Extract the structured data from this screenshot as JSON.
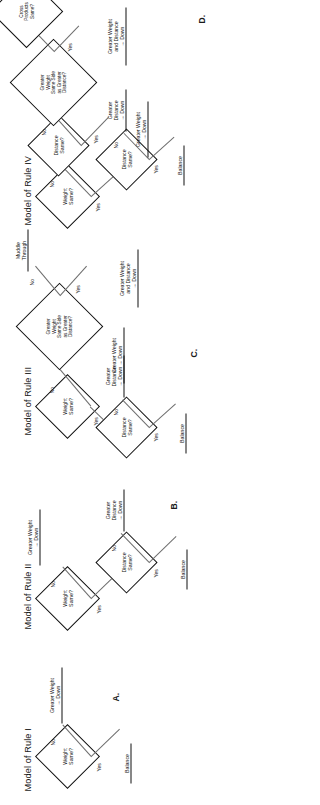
{
  "figure": {
    "orientation": "rotated-90-ccw",
    "caption_letters": [
      "A.",
      "B.",
      "C.",
      "D."
    ],
    "ink_color": "#111111",
    "line_color": "#6e6e6e"
  },
  "labels": {
    "yes": "Yes",
    "no": "No"
  },
  "questions": {
    "weight_same": "Weight\nSame?",
    "distance_same": "Distance\nSame?",
    "greater_weight_side": "Greater\nWeight\nSame Side\nas Greater\nDistance?",
    "cross_products_same": "Cross\nProducts\nSame?"
  },
  "outcomes": {
    "balance": "Balance",
    "greater_weight_down": "Greater Weight\n→ Down",
    "greater_distance_down": "Greater\nDistance\n→ Down",
    "greater_weight_and_distance_down": "Greater Weight\nand Distance\n→ Down",
    "muddle_through": "Muddle\nThrough",
    "greater_product_down": "Greater\nProduct\n→ Down"
  },
  "panels": [
    {
      "id": "rule1",
      "title": "Model of Rule I",
      "letter": "A."
    },
    {
      "id": "rule2",
      "title": "Model of Rule II",
      "letter": "B."
    },
    {
      "id": "rule3",
      "title": "Model of Rule III",
      "letter": "C."
    },
    {
      "id": "rule4",
      "title": "Model of Rule IV",
      "letter": "D."
    }
  ]
}
